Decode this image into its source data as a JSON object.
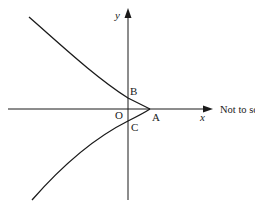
{
  "diagram": {
    "axes": {
      "x_label": "x",
      "y_label": "y"
    },
    "points": {
      "origin": "O",
      "A": "A",
      "B": "B",
      "C": "C"
    },
    "note": "Not to scale",
    "curves": [
      {
        "name": "upper-curve",
        "description": "curve through B meeting x-axis at A"
      },
      {
        "name": "lower-curve",
        "description": "curve through C meeting x-axis at A"
      }
    ]
  }
}
